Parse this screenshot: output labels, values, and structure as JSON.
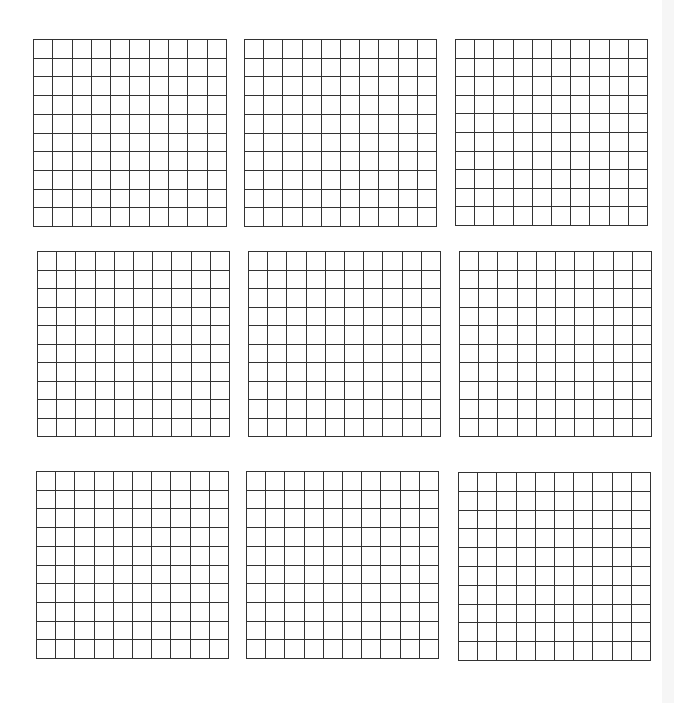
{
  "page": {
    "background": "#ffffff",
    "line_color": "#333333",
    "edge_strip_color": "#f6f6f6"
  },
  "grids": [
    {
      "id": "grid-1",
      "rows": 10,
      "cols": 10,
      "x": 33,
      "y": 39,
      "w": 194,
      "h": 188
    },
    {
      "id": "grid-2",
      "rows": 10,
      "cols": 10,
      "x": 244,
      "y": 39,
      "w": 193,
      "h": 188
    },
    {
      "id": "grid-3",
      "rows": 10,
      "cols": 10,
      "x": 455,
      "y": 39,
      "w": 193,
      "h": 187
    },
    {
      "id": "grid-4",
      "rows": 10,
      "cols": 10,
      "x": 37,
      "y": 251,
      "w": 193,
      "h": 186
    },
    {
      "id": "grid-5",
      "rows": 10,
      "cols": 10,
      "x": 248,
      "y": 251,
      "w": 193,
      "h": 186
    },
    {
      "id": "grid-6",
      "rows": 10,
      "cols": 10,
      "x": 459,
      "y": 251,
      "w": 193,
      "h": 186
    },
    {
      "id": "grid-7",
      "rows": 10,
      "cols": 10,
      "x": 36,
      "y": 471,
      "w": 193,
      "h": 188
    },
    {
      "id": "grid-8",
      "rows": 10,
      "cols": 10,
      "x": 246,
      "y": 471,
      "w": 193,
      "h": 188
    },
    {
      "id": "grid-9",
      "rows": 10,
      "cols": 10,
      "x": 458,
      "y": 472,
      "w": 193,
      "h": 189
    }
  ]
}
